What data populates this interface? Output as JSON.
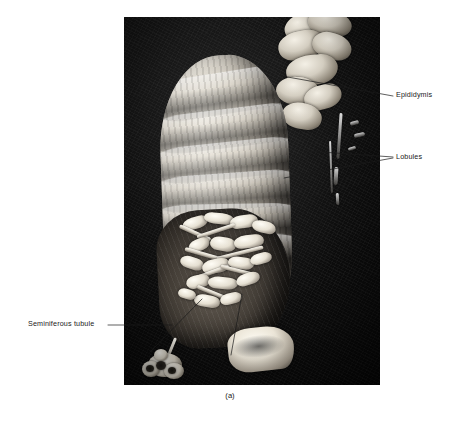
{
  "figure": {
    "caption": "(a)",
    "plate_background_color": "#0b0b0b",
    "page_background_color": "#ffffff",
    "label_text_color": "#1a1a1a",
    "leader_line_color": "#1a1a1a",
    "specimen_description": "black-and-white photograph of a dissected testis with epididymis"
  },
  "labels": [
    {
      "id": "epididymis",
      "text": "Epididymis",
      "target": "convoluted structure at upper right of specimen",
      "leader": "single straight line"
    },
    {
      "id": "lobules",
      "text": "Lobules",
      "target": "ridged surface divisions of the testis body",
      "leader": "two converging straight lines"
    },
    {
      "id": "seminiferous_tubule",
      "text": "Seminiferous tubule",
      "target": "teased-out tubule at lower left of plate",
      "leader": "horizontal line plus two converging lines"
    }
  ],
  "icons": {
    "leader_line": "leader-line",
    "photo_plate": "photograph-plate"
  }
}
